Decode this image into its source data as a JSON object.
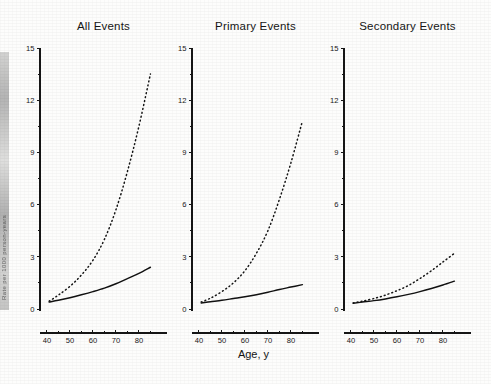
{
  "figure": {
    "x_axis_label": "Age, y",
    "y_axis_label_partial": "Rate per 1000 person-years",
    "y_ticks": [
      "0",
      "3",
      "6",
      "9",
      "12",
      "15"
    ],
    "x_ticks": [
      "40",
      "50",
      "60",
      "70",
      "80"
    ]
  },
  "chart_data": {
    "type": "line",
    "title": "",
    "xlabel": "Age, y",
    "ylabel": "Rate per 1000 person-years",
    "xlim": [
      37,
      87
    ],
    "ylim": [
      0,
      15
    ],
    "grid": false,
    "legend": "none",
    "panels": [
      {
        "title": "All Events",
        "x": [
          41,
          45,
          50,
          55,
          60,
          65,
          70,
          75,
          80,
          85
        ],
        "series": [
          {
            "name": "Dotted curve",
            "style": "dotted",
            "values": [
              0.45,
              0.8,
              1.3,
              1.95,
              2.8,
              4.0,
              5.7,
              7.9,
              10.5,
              13.5
            ]
          },
          {
            "name": "Solid curve",
            "style": "solid",
            "values": [
              0.4,
              0.5,
              0.65,
              0.82,
              1.0,
              1.2,
              1.45,
              1.75,
              2.05,
              2.4
            ]
          }
        ]
      },
      {
        "title": "Primary Events",
        "x": [
          41,
          45,
          50,
          55,
          60,
          65,
          70,
          75,
          80,
          85
        ],
        "series": [
          {
            "name": "Dotted curve",
            "style": "dotted",
            "values": [
              0.4,
              0.62,
              1.0,
              1.5,
              2.2,
              3.2,
              4.5,
              6.3,
              8.4,
              10.8
            ]
          },
          {
            "name": "Solid curve",
            "style": "solid",
            "values": [
              0.35,
              0.42,
              0.5,
              0.6,
              0.7,
              0.82,
              0.96,
              1.12,
              1.26,
              1.4
            ]
          }
        ]
      },
      {
        "title": "Secondary Events",
        "x": [
          41,
          45,
          50,
          55,
          60,
          65,
          70,
          75,
          80,
          85
        ],
        "series": [
          {
            "name": "Dotted curve",
            "style": "dotted",
            "values": [
              0.35,
              0.45,
              0.6,
              0.8,
              1.05,
              1.35,
              1.75,
              2.2,
              2.7,
              3.2
            ]
          },
          {
            "name": "Solid curve",
            "style": "solid",
            "values": [
              0.33,
              0.4,
              0.48,
              0.58,
              0.7,
              0.84,
              1.0,
              1.18,
              1.38,
              1.6
            ]
          }
        ]
      }
    ]
  }
}
